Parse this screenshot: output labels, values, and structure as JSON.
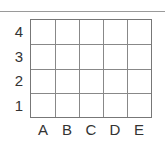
{
  "grid": {
    "rows": [
      "4",
      "3",
      "2",
      "1"
    ],
    "columns": [
      "A",
      "B",
      "C",
      "D",
      "E"
    ],
    "line_color": "#888888"
  }
}
